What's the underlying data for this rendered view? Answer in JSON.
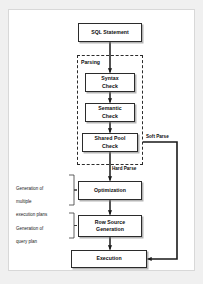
{
  "diagram": {
    "colors": {
      "page_background": "#f0f0f0",
      "card_background": "#ffffff",
      "card_border": "#d8d8d8",
      "node_border": "#2b2b2b",
      "node_fill": "#ffffff",
      "connector": "#1a1a1a",
      "text": "#0d0d0d",
      "shadow": "rgba(120,120,120,0.55)"
    },
    "nodes": [
      {
        "id": "sql-statement",
        "label": "SQL Statement",
        "lines": [
          "SQL Statement"
        ]
      },
      {
        "id": "syntax-check",
        "label": "Syntax Check",
        "lines": [
          "Syntax",
          "Check"
        ]
      },
      {
        "id": "semantic-check",
        "label": "Semantic Check",
        "lines": [
          "Semantic",
          "Check"
        ]
      },
      {
        "id": "shared-pool-check",
        "label": "Shared Pool Check",
        "lines": [
          "Shared Pool",
          "Check"
        ]
      },
      {
        "id": "optimization",
        "label": "Optimization",
        "lines": [
          "Optimization"
        ]
      },
      {
        "id": "row-source-generation",
        "label": "Row Source Generation",
        "lines": [
          "Row Source",
          "Generation"
        ]
      },
      {
        "id": "execution",
        "label": "Execution",
        "lines": [
          "Execution"
        ]
      }
    ],
    "group": {
      "id": "parsing",
      "label": "Parsing",
      "style": "dashed",
      "contains": [
        "syntax-check",
        "semantic-check",
        "shared-pool-check"
      ]
    },
    "edge_labels": [
      {
        "id": "soft-parse",
        "label": "Soft Parse"
      },
      {
        "id": "hard-parse",
        "label": "Hard Parse"
      }
    ],
    "annotations": [
      {
        "id": "multiple-execution-plans",
        "lines": [
          "Generation of",
          "multiple",
          "execution plans"
        ],
        "text": "Generation of multiple execution plans",
        "points_to": "optimization"
      },
      {
        "id": "query-plan",
        "lines": [
          "Generation of",
          "query plan"
        ],
        "text": "Generation of query plan",
        "points_to": "row-source-generation"
      }
    ],
    "edges": [
      {
        "from": "sql-statement",
        "to": "syntax-check",
        "label": ""
      },
      {
        "from": "syntax-check",
        "to": "semantic-check",
        "label": ""
      },
      {
        "from": "semantic-check",
        "to": "shared-pool-check",
        "label": ""
      },
      {
        "from": "shared-pool-check",
        "to": "optimization",
        "label": "Hard Parse"
      },
      {
        "from": "shared-pool-check",
        "to": "execution",
        "label": "Soft Parse"
      },
      {
        "from": "optimization",
        "to": "row-source-generation",
        "label": ""
      },
      {
        "from": "row-source-generation",
        "to": "execution",
        "label": ""
      }
    ]
  }
}
